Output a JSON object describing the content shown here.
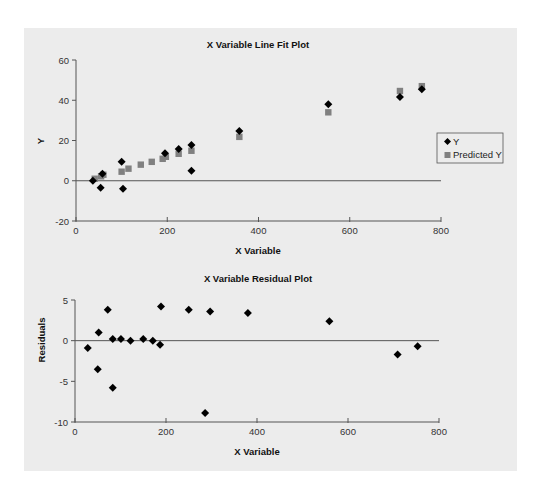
{
  "chart_data": [
    {
      "type": "scatter",
      "title": "X Variable Line Fit Plot",
      "xlabel": "X Variable",
      "ylabel": "Y",
      "xlim": [
        0,
        800
      ],
      "ylim": [
        -20,
        60
      ],
      "xticks": [
        "0",
        "200",
        "400",
        "600",
        "800"
      ],
      "yticks": [
        "60",
        "40",
        "20",
        "0",
        "-20"
      ],
      "grid": false,
      "legend_position": "right",
      "zero_line": true,
      "series": [
        {
          "name": "Y",
          "marker": "diamond",
          "color": "#000000",
          "points": [
            [
              37,
              0
            ],
            [
              54,
              -3.5
            ],
            [
              58,
              3.5
            ],
            [
              100,
              9.4
            ],
            [
              103,
              -4
            ],
            [
              195,
              13.7
            ],
            [
              225,
              15.8
            ],
            [
              253,
              17.8
            ],
            [
              253,
              5
            ],
            [
              358,
              24.7
            ],
            [
              553,
              38
            ],
            [
              710,
              41.6
            ],
            [
              758,
              45.5
            ]
          ]
        },
        {
          "name": "Predicted Y",
          "marker": "square",
          "color": "#808080",
          "points": [
            [
              41,
              1
            ],
            [
              55,
              2.2
            ],
            [
              60,
              3
            ],
            [
              100,
              4.5
            ],
            [
              115,
              6
            ],
            [
              142,
              8
            ],
            [
              166,
              9.4
            ],
            [
              190,
              10.9
            ],
            [
              197,
              11.9
            ],
            [
              225,
              13.4
            ],
            [
              253,
              14.9
            ],
            [
              358,
              21.8
            ],
            [
              553,
              34
            ],
            [
              710,
              44.6
            ],
            [
              758,
              47
            ]
          ]
        }
      ]
    },
    {
      "type": "scatter",
      "title": "X Variable Residual Plot",
      "xlabel": "X Variable",
      "ylabel": "Residuals",
      "xlim": [
        0,
        800
      ],
      "ylim": [
        -10,
        5
      ],
      "xticks": [
        "0",
        "200",
        "400",
        "600",
        "800"
      ],
      "yticks": [
        "5",
        "0",
        "-5",
        "-10"
      ],
      "grid": false,
      "zero_line": true,
      "series": [
        {
          "name": "Residuals",
          "marker": "diamond",
          "color": "#000000",
          "points": [
            [
              28,
              -0.9
            ],
            [
              50,
              -3.5
            ],
            [
              52,
              1
            ],
            [
              72,
              3.8
            ],
            [
              83,
              -5.8
            ],
            [
              83,
              0.2
            ],
            [
              101,
              0.2
            ],
            [
              122,
              0
            ],
            [
              150,
              0.2
            ],
            [
              171,
              0
            ],
            [
              187,
              -0.5
            ],
            [
              189,
              4.2
            ],
            [
              250,
              3.8
            ],
            [
              286,
              -8.9
            ],
            [
              297,
              3.6
            ],
            [
              380,
              3.4
            ],
            [
              559,
              2.4
            ],
            [
              709,
              -1.7
            ],
            [
              753,
              -0.7
            ]
          ]
        }
      ]
    }
  ]
}
